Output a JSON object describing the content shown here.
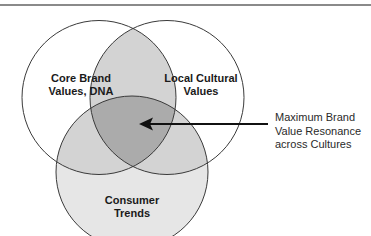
{
  "diagram": {
    "type": "venn",
    "circles": [
      {
        "id": "core",
        "label_lines": [
          "Core Brand",
          "Values, DNA"
        ]
      },
      {
        "id": "local",
        "label_lines": [
          "Local Cultural",
          "Values"
        ]
      },
      {
        "id": "consumer",
        "label_lines": [
          "Consumer",
          "Trends"
        ]
      }
    ],
    "callout": {
      "lines": [
        "Maximum Brand",
        "Value Resonance",
        "across Cultures"
      ],
      "points_to": "intersection of all three circles"
    },
    "colors": {
      "outline": "#3a3a3a",
      "pair_overlap": "#d2d2d2",
      "triple_overlap": "#a9a9a9",
      "consumer_fill": "#e4e4e4",
      "arrow": "#111111"
    }
  }
}
